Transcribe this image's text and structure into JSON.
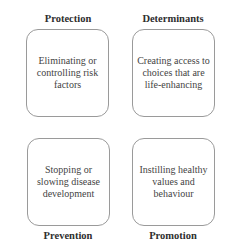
{
  "quadrants": [
    {
      "label": "Protection",
      "text": "Eliminating or controlling risk factors"
    },
    {
      "label": "Determinants",
      "text": "Creating access to choices that are life-enhancing"
    },
    {
      "label": "Prevention",
      "text": "Stopping or slowing disease development"
    },
    {
      "label": "Promotion",
      "text": "Instilling healthy values and behaviour"
    }
  ],
  "colors": {
    "border": "#9a9a9a",
    "text": "#444444",
    "label": "#2e2e2e"
  }
}
